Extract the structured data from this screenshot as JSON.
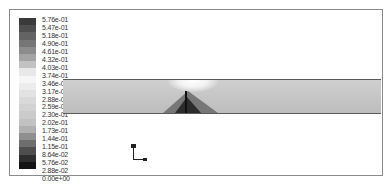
{
  "figure": {
    "type": "contour-plot"
  },
  "legend": {
    "labels": [
      "5.76e-01",
      "5.47e-01",
      "5.18e-01",
      "4.90e-01",
      "4.61e-01",
      "4.32e-01",
      "4.03e-01",
      "3.74e-01",
      "3.46e-01",
      "3.17e-01",
      "2.88e-01",
      "2.59e-01",
      "2.30e-01",
      "2.02e-01",
      "1.73e-01",
      "1.44e-01",
      "1.15e-01",
      "8.64e-02",
      "5.76e-02",
      "2.88e-02",
      "0.00e+00"
    ],
    "colors": [
      "#3a3a3a",
      "#4e4e4e",
      "#636363",
      "#767676",
      "#8c8c8c",
      "#a4a4a4",
      "#c2c2c2",
      "#e8e8e8",
      "#f6f6f6",
      "#ececec",
      "#e2e2e2",
      "#d9d9d9",
      "#d2d2d2",
      "#cbcbcb",
      "#c2c2c2",
      "#b0b0b0",
      "#8f8f8f",
      "#6e6e6e",
      "#4e4e4e",
      "#2e2e2e",
      "#141414"
    ]
  },
  "axes_triad": {
    "icon": "xy-axes-icon"
  }
}
